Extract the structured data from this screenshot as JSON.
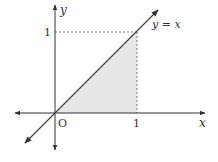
{
  "diagram": {
    "type": "coordinate-plot",
    "line_label": "y = x",
    "x_axis_label": "x",
    "y_axis_label": "y",
    "origin_label": "O",
    "x_tick_label": "1",
    "y_tick_label": "1",
    "shaded_region": "triangle under y=x from x=0 to x=1",
    "colors": {
      "axis": "#333333",
      "line": "#444444",
      "shade": "#e6e6e6",
      "dashed": "#555555"
    }
  }
}
